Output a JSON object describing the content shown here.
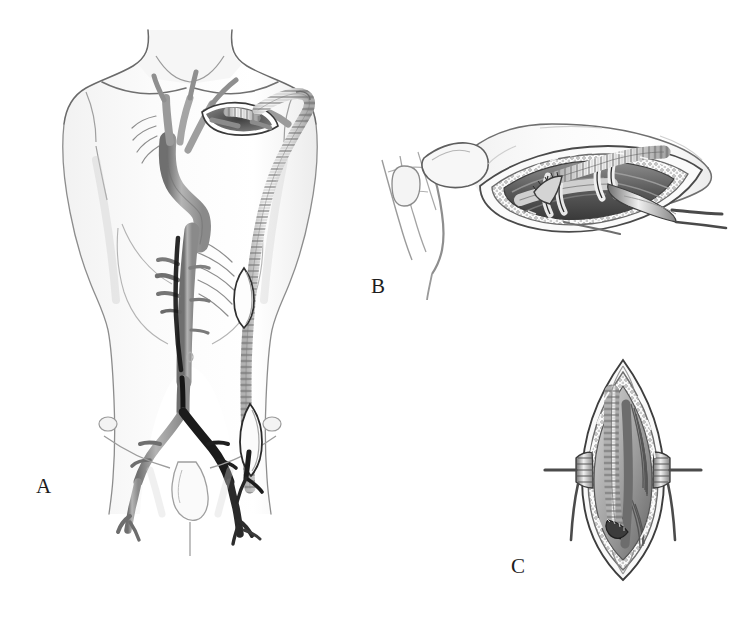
{
  "figure": {
    "domain": "medical-illustration",
    "style": "grayscale pencil / graphite line drawing",
    "background_color": "#ffffff",
    "ink_color": "#1d1d1d",
    "width": 741,
    "height": 626,
    "panel_count": 3
  },
  "labels": {
    "a": "A",
    "b": "B",
    "c": "C"
  },
  "panels": [
    {
      "id": "a",
      "label": "A",
      "label_position": {
        "x": 36,
        "y": 476
      },
      "caption": "Anterior view of male torso showing the completed axillofemoral bypass: ringed prosthetic graft originating from the right axillary artery, tunneled subcutaneously along the lateral chest and abdominal wall to the femoral artery, with diseased aorta and iliac vessels shown beneath.",
      "contents": [
        "male torso outline, neck to mid-thigh",
        "clavicles and shoulder girdle",
        "costal margin / rib cage outline",
        "thoracic and abdominal aorta with visceral branches",
        "occluded aortoiliac segment rendered dark",
        "common, external and internal iliac arteries",
        "common femoral arteries",
        "infraclavicular incision with exposed axillary artery",
        "ringed externally supported bypass graft",
        "lateral counter-incision midway down the flank",
        "groin incision with distal graft anastomosis"
      ]
    },
    {
      "id": "b",
      "label": "B",
      "label_position": {
        "x": 371,
        "y": 276
      },
      "caption": "Close-up of the infraclavicular exposure: the axillary artery is controlled with vessel loops and the ringed graft is anastomosed end-to-side; pectoralis major fibers are split and the wound edges are retracted.",
      "contents": [
        "clavicle",
        "sternocleidomastoid and neck vessels",
        "retracted infraclavicular wound edges",
        "pectoralis major muscle fibers",
        "axillary artery",
        "vessel loops / encircling tapes",
        "end-to-side graft anastomosis",
        "ringed prosthetic graft limb"
      ]
    },
    {
      "id": "c",
      "label": "C",
      "label_position": {
        "x": 511,
        "y": 556
      },
      "caption": "Close-up of the groin exposure: a vertical femoral incision held open with self-retaining retractors reveals the common femoral artery with the ringed graft sewn end-to-side to it.",
      "contents": [
        "vertical longitudinal groin incision",
        "self-retaining retractor blades",
        "subcutaneous fat and lymphatic tissue",
        "common femoral artery",
        "ringed prosthetic graft",
        "end-to-side femoral anastomosis",
        "profunda femoris / branch vessel"
      ]
    }
  ]
}
